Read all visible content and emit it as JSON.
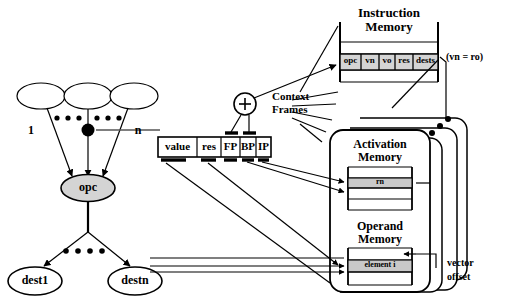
{
  "diagram": {
    "title_hidden": "Context frame / instruction memory dataflow diagram",
    "instruction_memory": {
      "title_line1": "Instruction",
      "title_line2": "Memory",
      "fields": [
        "opc",
        "vn",
        "vo",
        "res",
        "dests"
      ],
      "note": "(vn = ro)"
    },
    "activation_memory": {
      "title_line1": "Activation",
      "title_line2": "Memory",
      "highlight_row": "rn"
    },
    "operand_memory": {
      "title_line1": "Operand",
      "title_line2": "Memory",
      "highlight_row": "element i"
    },
    "context_frames": {
      "label_line1": "Context",
      "label_line2": "Frames"
    },
    "vector_offset": {
      "label_line1": "vector",
      "label_line2": "offset"
    },
    "adder_node": "+",
    "graph": {
      "opcode_node": "opc",
      "input_labels": [
        "1",
        "i",
        "n"
      ],
      "dest_nodes": [
        "dest1",
        "destn"
      ]
    },
    "register_bar": {
      "fields": [
        "value",
        "res",
        "FP",
        "BP",
        "IP"
      ]
    },
    "colors": {
      "stroke": "#000000",
      "shade_light": "#d4d4d4",
      "shade_mid": "#b9b9b9",
      "background": "#ffffff"
    }
  }
}
